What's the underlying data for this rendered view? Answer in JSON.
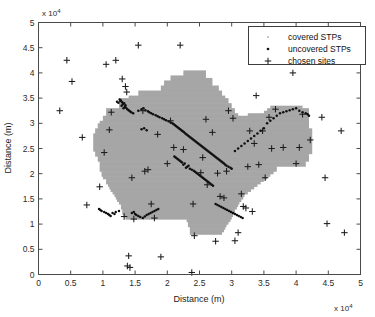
{
  "figure": {
    "background": "#ffffff",
    "frame_color": "#4a4a4a"
  },
  "chart_data": {
    "type": "scatter",
    "title": "",
    "xlabel": "Distance (m)",
    "ylabel": "Distance (m)",
    "x_exponent_label": "x 10",
    "x_exponent_power": "4",
    "y_exponent_label": "x 10",
    "y_exponent_power": "4",
    "xlim": [
      0,
      5
    ],
    "ylim": [
      0,
      5
    ],
    "xticks": [
      0,
      0.5,
      1,
      1.5,
      2,
      2.5,
      3,
      3.5,
      4,
      4.5,
      5
    ],
    "xticklabels": [
      "0",
      "0.5",
      "1",
      "1.5",
      "2",
      "2.5",
      "3",
      "3.5",
      "4",
      "4.5",
      "5"
    ],
    "yticks": [
      0,
      0.5,
      1,
      1.5,
      2,
      2.5,
      3,
      3.5,
      4,
      4.5,
      5
    ],
    "yticklabels": [
      "0",
      "0.5",
      "1",
      "1.5",
      "2",
      "2.5",
      "3",
      "3.5",
      "4",
      "4.5",
      "5"
    ],
    "grid": false,
    "legend_position": "upper right",
    "units_note": "axis values are in units of 1e4 metres",
    "series": [
      {
        "name": "covered STPs",
        "marker": "dot-small",
        "color": "#8f8f8f",
        "description": "STPs falling inside the grey covered service region",
        "note": "rendered as the grey shaded coverage cells",
        "values": []
      },
      {
        "name": "uncovered STPs",
        "marker": "dot",
        "color": "#101010",
        "x": [
          1.28,
          1.3,
          1.33,
          1.31,
          1.35,
          1.29,
          1.34,
          1.36,
          1.32,
          1.38,
          1.27,
          1.4,
          1.42,
          1.26,
          1.44,
          1.47,
          1.22,
          1.24,
          1.55,
          1.6,
          1.63,
          1.66,
          1.7,
          1.72,
          1.75,
          1.78,
          1.82,
          1.85,
          1.88,
          1.92,
          1.95,
          1.98,
          2.02,
          2.05,
          2.08,
          2.1,
          2.12,
          2.14,
          2.16,
          2.18,
          2.2,
          2.22,
          2.24,
          2.26,
          2.28,
          2.3,
          2.32,
          2.34,
          2.36,
          2.38,
          2.4,
          2.42,
          2.44,
          2.46,
          2.48,
          2.5,
          2.52,
          2.54,
          2.56,
          2.58,
          2.6,
          2.62,
          2.64,
          2.66,
          2.68,
          2.7,
          2.72,
          2.74,
          2.76,
          2.78,
          2.8,
          2.82,
          2.84,
          2.86,
          2.88,
          2.9,
          2.92,
          2.95,
          2.98,
          3.0,
          3.05,
          3.1,
          3.15,
          3.2,
          3.25,
          3.3,
          3.35,
          3.4,
          3.45,
          3.5,
          3.55,
          3.6,
          3.65,
          3.7,
          3.75,
          3.8,
          3.85,
          3.9,
          3.95,
          4.0,
          4.05,
          4.1,
          4.15,
          4.18,
          4.2,
          2.35,
          2.38,
          2.41,
          2.29,
          2.31,
          2.33,
          2.25,
          2.27,
          2.23,
          2.21,
          2.19,
          2.17,
          2.15,
          2.13,
          2.11,
          2.43,
          2.45,
          2.47,
          2.49,
          2.51,
          2.53,
          2.55,
          2.57,
          2.59,
          2.61,
          2.63,
          2.65,
          2.67,
          2.69,
          2.71,
          1.5,
          1.52,
          1.45,
          1.48,
          1.55,
          1.58,
          1.62,
          1.65,
          1.68,
          1.71,
          1.74,
          1.77,
          1.8,
          1.83,
          1.86,
          2.75,
          2.78,
          2.81,
          2.84,
          2.87,
          2.9,
          2.93,
          2.96,
          2.99,
          3.02,
          3.05,
          3.08,
          3.11,
          3.14,
          3.17,
          1.15,
          1.18,
          1.2,
          1.25,
          1.1,
          1.12,
          1.08,
          1.05,
          1.02,
          0.98,
          0.96,
          0.94,
          1.6,
          1.64,
          1.68
        ],
        "y": [
          3.45,
          3.42,
          3.4,
          3.38,
          3.36,
          3.35,
          3.33,
          3.31,
          3.3,
          3.28,
          3.44,
          3.26,
          3.24,
          3.47,
          3.22,
          3.2,
          3.43,
          3.41,
          3.25,
          3.28,
          3.3,
          3.26,
          3.24,
          3.22,
          3.2,
          3.18,
          3.16,
          3.14,
          3.12,
          3.1,
          3.08,
          3.06,
          3.04,
          3.02,
          3.0,
          2.98,
          2.96,
          2.94,
          2.92,
          2.9,
          2.88,
          2.86,
          2.84,
          2.82,
          2.8,
          2.78,
          2.76,
          2.74,
          2.72,
          2.7,
          2.68,
          2.66,
          2.64,
          2.62,
          2.6,
          2.58,
          2.56,
          2.54,
          2.52,
          2.5,
          2.48,
          2.46,
          2.44,
          2.42,
          2.4,
          2.38,
          2.36,
          2.34,
          2.32,
          2.3,
          2.28,
          2.26,
          2.24,
          2.22,
          2.2,
          2.18,
          2.16,
          2.14,
          2.12,
          2.1,
          2.45,
          2.5,
          2.55,
          2.6,
          2.65,
          2.7,
          2.75,
          2.8,
          2.85,
          2.9,
          3.0,
          3.05,
          3.1,
          3.15,
          3.2,
          3.22,
          3.24,
          3.26,
          3.28,
          3.3,
          3.25,
          3.22,
          3.2,
          3.18,
          3.15,
          2.1,
          2.08,
          2.06,
          2.12,
          2.14,
          2.16,
          2.18,
          2.2,
          2.22,
          2.24,
          2.26,
          2.28,
          2.3,
          2.32,
          2.34,
          2.04,
          2.02,
          2.0,
          1.98,
          1.96,
          1.94,
          1.92,
          1.9,
          1.88,
          1.86,
          1.84,
          1.82,
          1.8,
          1.78,
          1.76,
          1.2,
          1.18,
          1.22,
          1.24,
          1.16,
          1.14,
          1.12,
          1.15,
          1.18,
          1.2,
          1.22,
          1.24,
          1.26,
          1.28,
          1.3,
          1.4,
          1.38,
          1.36,
          1.34,
          1.32,
          1.3,
          1.28,
          1.26,
          1.24,
          1.22,
          1.2,
          1.18,
          1.16,
          1.14,
          1.12,
          1.22,
          1.2,
          1.24,
          1.26,
          1.18,
          1.16,
          1.2,
          1.22,
          1.24,
          1.26,
          1.28,
          1.3,
          2.88,
          2.9,
          2.86
        ]
      },
      {
        "name": "chosen sites",
        "marker": "plus",
        "color": "#1c1c1c",
        "x": [
          0.33,
          0.44,
          0.52,
          0.68,
          0.75,
          0.95,
          1.02,
          1.05,
          1.1,
          1.13,
          1.2,
          1.3,
          1.35,
          1.37,
          1.38,
          1.4,
          1.42,
          1.45,
          1.55,
          1.62,
          1.65,
          1.7,
          1.75,
          1.8,
          1.9,
          2.05,
          2.1,
          2.2,
          2.25,
          2.38,
          2.4,
          2.42,
          2.52,
          2.55,
          2.6,
          2.62,
          2.7,
          2.75,
          2.78,
          2.82,
          2.88,
          2.95,
          3.02,
          3.1,
          3.15,
          3.18,
          3.22,
          3.25,
          3.28,
          3.32,
          3.35,
          3.38,
          3.42,
          3.48,
          3.52,
          3.58,
          3.62,
          3.68,
          3.8,
          3.95,
          4.0,
          4.05,
          4.1,
          4.22,
          4.4,
          4.45,
          4.48,
          4.7,
          4.75,
          2.0,
          1.85,
          1.48,
          1.33,
          3.05,
          2.92
        ],
        "y": [
          3.25,
          4.25,
          3.83,
          2.72,
          1.38,
          1.74,
          2.42,
          4.17,
          2.87,
          3.22,
          4.25,
          3.88,
          3.73,
          3.62,
          0.17,
          0.37,
          0.14,
          1.92,
          4.55,
          3.25,
          2.05,
          2.08,
          1.4,
          1.12,
          0.35,
          3.05,
          2.52,
          4.55,
          2.48,
          0.04,
          1.4,
          0.77,
          2.02,
          2.32,
          3.08,
          1.78,
          2.82,
          0.66,
          2.01,
          1.55,
          1.52,
          3.25,
          3.1,
          0.83,
          1.6,
          1.35,
          1.32,
          2.14,
          2.85,
          1.25,
          2.6,
          3.55,
          2.18,
          2.85,
          1.92,
          3.12,
          2.5,
          3.28,
          2.52,
          4.0,
          2.2,
          2.52,
          3.18,
          2.67,
          3.12,
          1.92,
          1.01,
          2.85,
          0.83,
          2.2,
          2.78,
          1.1,
          1.15,
          0.67,
          2.05
        ]
      }
    ],
    "coverage_region": {
      "label": "covered area",
      "color": "#a6a6a6",
      "description": "blocky grid-cell polygon of covered service area"
    }
  },
  "legend": {
    "entries": [
      {
        "label": "covered STPs",
        "marker": "dot-small",
        "color": "#8f8f8f"
      },
      {
        "label": "uncovered STPs",
        "marker": "dot",
        "color": "#101010"
      },
      {
        "label": "chosen sites",
        "marker": "plus",
        "color": "#1c1c1c"
      }
    ]
  }
}
